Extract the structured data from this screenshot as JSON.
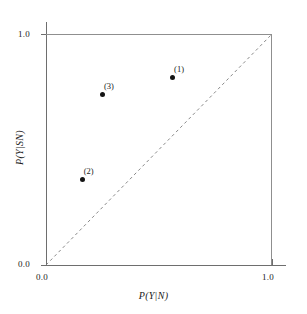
{
  "chart_data": {
    "type": "scatter",
    "title": "",
    "xlabel": "P(Y|N)",
    "ylabel": "P(Y|SN)",
    "xlim": [
      0.0,
      1.0
    ],
    "ylim": [
      0.0,
      1.0
    ],
    "xticks": [
      "0.0",
      "1.0"
    ],
    "yticks": [
      "0.0",
      "1.0"
    ],
    "grid": false,
    "legend": "none",
    "reference_line": {
      "name": "chance-diagonal",
      "style": "dashed",
      "from": [
        0.0,
        0.0
      ],
      "to": [
        1.0,
        1.0
      ]
    },
    "points": [
      {
        "label": "(1)",
        "x": 0.56,
        "y": 0.81
      },
      {
        "label": "(2)",
        "x": 0.16,
        "y": 0.37
      },
      {
        "label": "(3)",
        "x": 0.25,
        "y": 0.74
      }
    ]
  },
  "axes": {
    "x_title": "P(Y|N)",
    "y_title": "P(Y|SN)",
    "x_tick_min": "0.0",
    "x_tick_max": "1.0",
    "y_tick_min": "0.0",
    "y_tick_max": "1.0"
  },
  "points": {
    "p1": {
      "label": "(1)"
    },
    "p2": {
      "label": "(2)"
    },
    "p3": {
      "label": "(3)"
    }
  },
  "colors": {
    "marker": "#141414",
    "frame": "#8f8f8f",
    "axis": "#6e6e6e",
    "background": "#ffffff"
  }
}
